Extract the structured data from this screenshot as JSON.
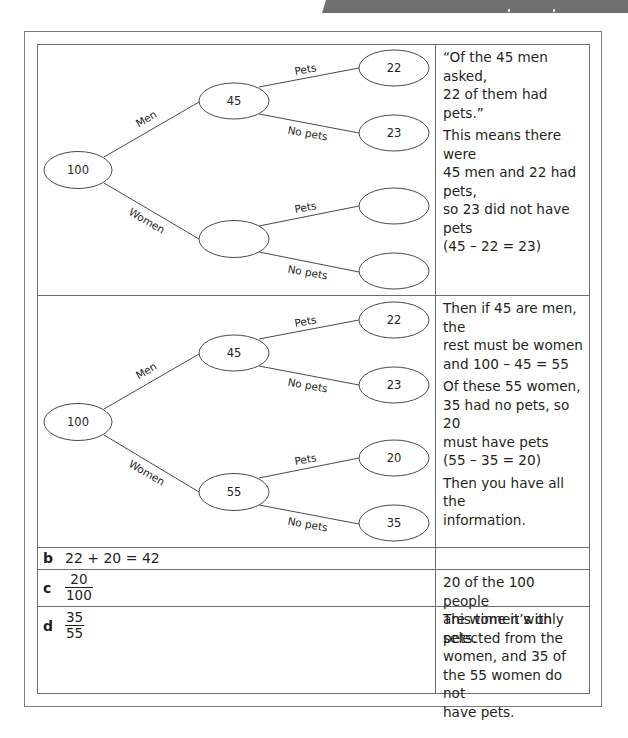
{
  "banner": {
    "color": "#6f6f6f"
  },
  "colors": {
    "border": "#6d6d6d",
    "text": "#231f20",
    "outer_border": "#7a7a7a"
  },
  "rows": {
    "tree1": {
      "nodes": {
        "root": "100",
        "men": "45",
        "women": "",
        "men_pets": "22",
        "men_no_pets": "23",
        "women_pets": "",
        "women_no_pets": ""
      },
      "labels": {
        "men": "Men",
        "women": "Women",
        "pets_top": "Pets",
        "no_pets_top": "No pets",
        "pets_bottom": "Pets",
        "no_pets_bottom": "No pets"
      },
      "explanation": [
        "“Of the 45 men asked,\n22 of them had pets.”",
        "This means there were\n45 men and 22 had pets,\nso 23 did not have pets\n(45 – 22 = 23)"
      ]
    },
    "tree2": {
      "nodes": {
        "root": "100",
        "men": "45",
        "women": "55",
        "men_pets": "22",
        "men_no_pets": "23",
        "women_pets": "20",
        "women_no_pets": "35"
      },
      "labels": {
        "men": "Men",
        "women": "Women",
        "pets_top": "Pets",
        "no_pets_top": "No pets",
        "pets_bottom": "Pets",
        "no_pets_bottom": "No pets"
      },
      "explanation": [
        "Then if 45 are men, the\nrest must be women\nand 100 – 45 = 55",
        "Of these 55 women,\n35 had no pets, so 20\nmust have pets\n(55 – 35 = 20)",
        "Then you have all the\ninformation."
      ]
    },
    "b": {
      "letter": "b",
      "answer": "22 + 20 = 42",
      "explanation": ""
    },
    "c": {
      "letter": "c",
      "numerator": "20",
      "denominator": "100",
      "explanation": "20 of the 100 people\nare women with pets."
    },
    "d": {
      "letter": "d",
      "numerator": "35",
      "denominator": "55",
      "explanation": "This time it’s only\nselected from the\nwomen, and 35 of\nthe 55 women do not\nhave pets."
    }
  }
}
